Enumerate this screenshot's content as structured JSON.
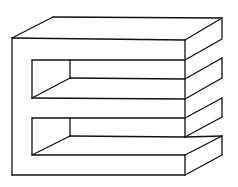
{
  "figure": {
    "type": "line-drawing",
    "stroke_color": "#111111",
    "background_color": "#ffffff"
  }
}
